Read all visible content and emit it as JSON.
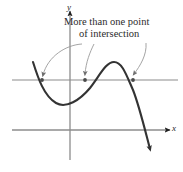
{
  "figure": {
    "caption": {
      "line1": "More than one point",
      "line2": "of intersection"
    },
    "axes": {
      "x_label": "x",
      "y_label": "y",
      "x_axis_y": 130,
      "y_axis_x": 70,
      "axis_color": "#8c8c8c",
      "arrow_color": "#1f1f1f"
    },
    "secant_line": {
      "name": "horizontal-test-line",
      "y": 80,
      "x_start": 12,
      "x_end": 178,
      "color": "#8c8c8c"
    },
    "curve": {
      "name": "cubic-curve",
      "color": "#333333",
      "stroke_width": 2.1,
      "start_point": [
        33,
        62
      ],
      "valley_point": [
        66,
        104
      ],
      "peak_point": [
        112,
        62
      ],
      "end_point": [
        150,
        152
      ]
    },
    "intersections": [
      {
        "label": "intersection-1",
        "x": 42,
        "y": 80
      },
      {
        "label": "intersection-2",
        "x": 85,
        "y": 80
      },
      {
        "label": "intersection-3",
        "x": 133,
        "y": 80
      }
    ],
    "leader_arrows": [
      {
        "name": "leader-arrow-left",
        "from": [
          80,
          44
        ],
        "to": [
          43,
          78
        ]
      },
      {
        "name": "leader-arrow-middle",
        "from": [
          92,
          44
        ],
        "to": [
          85,
          77
        ]
      },
      {
        "name": "leader-arrow-right",
        "from": [
          143,
          43
        ],
        "to": [
          133,
          77
        ]
      }
    ],
    "colors": {
      "background": "#ffffff",
      "curve": "#333333",
      "axis": "#8c8c8c",
      "annotation": "#6e6e6e",
      "text": "#2b2b2b"
    }
  }
}
